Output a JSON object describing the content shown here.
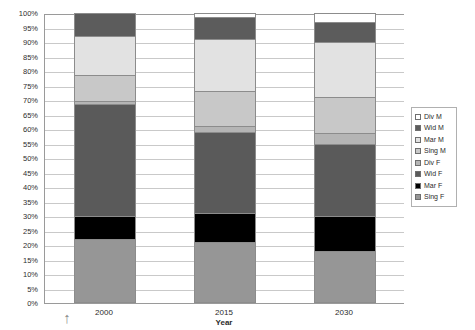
{
  "chart_data": {
    "type": "bar",
    "variant": "stacked-100-percent",
    "title": "",
    "xlabel": "Year",
    "ylabel": "",
    "categories": [
      "2000",
      "2015",
      "2030"
    ],
    "ylim": [
      0,
      100
    ],
    "ytick_labels": [
      "0%",
      "5%",
      "10%",
      "15%",
      "20%",
      "25%",
      "30%",
      "35%",
      "40%",
      "45%",
      "50%",
      "55%",
      "60%",
      "65%",
      "70%",
      "75%",
      "80%",
      "85%",
      "90%",
      "95%",
      "100%"
    ],
    "ytick_values": [
      0,
      5,
      10,
      15,
      20,
      25,
      30,
      35,
      40,
      45,
      50,
      55,
      60,
      65,
      70,
      75,
      80,
      85,
      90,
      95,
      100
    ],
    "grid": true,
    "legend_position": "right",
    "stack_order_bottom_to_top": [
      "Sing F",
      "Mar F",
      "Wid F",
      "Div F",
      "Sing M",
      "Mar M",
      "Wid M",
      "Div M"
    ],
    "legend_order_top_to_bottom": [
      "Div M",
      "Wid M",
      "Mar M",
      "Sing M",
      "Div F",
      "Wid F",
      "Mar F",
      "Sing F"
    ],
    "series": [
      {
        "name": "Sing F",
        "color": "#969696",
        "values": [
          22.0,
          21.0,
          18.0
        ]
      },
      {
        "name": "Mar F",
        "color": "#000000",
        "values": [
          8.0,
          10.0,
          12.0
        ]
      },
      {
        "name": "Wid F",
        "color": "#5a5a5a",
        "values": [
          38.5,
          28.0,
          25.0
        ]
      },
      {
        "name": "Div F",
        "color": "#b5b5b5",
        "values": [
          1.0,
          2.0,
          3.5
        ]
      },
      {
        "name": "Sing M",
        "color": "#c8c8c8",
        "values": [
          9.0,
          12.0,
          12.5
        ]
      },
      {
        "name": "Mar M",
        "color": "#e2e2e2",
        "values": [
          13.5,
          18.0,
          19.0
        ]
      },
      {
        "name": "Wid M",
        "color": "#5c5c5c",
        "values": [
          8.0,
          7.5,
          7.0
        ]
      },
      {
        "name": "Div M",
        "color": "#ffffff",
        "values": [
          0.0,
          1.5,
          3.0
        ]
      }
    ],
    "cumulative_tops": {
      "2000": {
        "Sing F": 22.0,
        "Mar F": 30.0,
        "Wid F": 68.5,
        "Div F": 69.5,
        "Sing M": 78.5,
        "Mar M": 92.0,
        "Wid M": 100.0,
        "Div M": 100.0
      },
      "2015": {
        "Sing F": 21.0,
        "Mar F": 31.0,
        "Wid F": 59.0,
        "Div F": 61.0,
        "Sing M": 73.0,
        "Mar M": 91.0,
        "Wid M": 98.5,
        "Div M": 100.0
      },
      "2030": {
        "Sing F": 18.0,
        "Mar F": 30.0,
        "Wid F": 55.0,
        "Div F": 58.5,
        "Sing M": 71.0,
        "Mar M": 90.0,
        "Wid M": 97.0,
        "Div M": 100.0
      }
    }
  },
  "legend": {
    "items": [
      {
        "label": "Div M",
        "color": "#ffffff"
      },
      {
        "label": "Wid M",
        "color": "#5c5c5c"
      },
      {
        "label": "Mar M",
        "color": "#e2e2e2"
      },
      {
        "label": "Sing M",
        "color": "#c8c8c8"
      },
      {
        "label": "Div F",
        "color": "#b5b5b5"
      },
      {
        "label": "Wid F",
        "color": "#5a5a5a"
      },
      {
        "label": "Mar F",
        "color": "#000000"
      },
      {
        "label": "Sing F",
        "color": "#969696"
      }
    ]
  },
  "annotations": {
    "arrow_mark": "↑"
  }
}
